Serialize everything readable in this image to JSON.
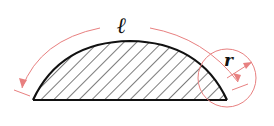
{
  "diagram": {
    "type": "circular-segment",
    "labels": {
      "arc_length": "ℓ",
      "radius": "r"
    },
    "colors": {
      "outline": "#111111",
      "hatch": "#222222",
      "dimension": "#e88080",
      "background": "#ffffff"
    }
  }
}
